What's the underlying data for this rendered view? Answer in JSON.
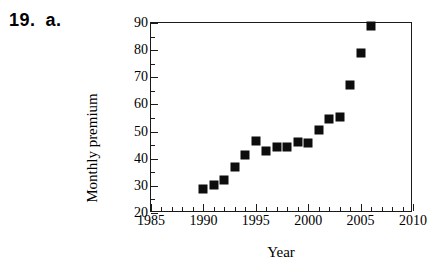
{
  "problem": {
    "number": "19.",
    "part": "a."
  },
  "chart_data": {
    "type": "scatter",
    "title": "",
    "xlabel": "Year",
    "ylabel": "Monthly premium",
    "xlim": [
      1985,
      2010
    ],
    "ylim": [
      20,
      90
    ],
    "grid": false,
    "legend": null,
    "x_major_ticks": [
      1985,
      1990,
      1995,
      2000,
      2005,
      2010
    ],
    "x_tick_labels": [
      "1985",
      "1990",
      "1995",
      "2000",
      "2005",
      "2010"
    ],
    "x_minor_tick_step": 1,
    "y_major_ticks": [
      20,
      30,
      40,
      50,
      60,
      70,
      80,
      90
    ],
    "y_tick_labels": [
      "20",
      "30",
      "40",
      "50",
      "60",
      "70",
      "80",
      "90"
    ],
    "y_minor_tick_step": 5,
    "marker": "filled-square",
    "marker_color": "#0d0d0d",
    "x": [
      1990,
      1991,
      1992,
      1993,
      1994,
      1995,
      1996,
      1997,
      1998,
      1999,
      2000,
      2001,
      2002,
      2003,
      2004,
      2005,
      2006
    ],
    "values": [
      29,
      30.2,
      32,
      37,
      41.5,
      46.5,
      43,
      44.2,
      44.3,
      46,
      45.9,
      50.5,
      54.5,
      55.3,
      67,
      79,
      89
    ],
    "points": [
      {
        "year": 1990,
        "premium": 29
      },
      {
        "year": 1991,
        "premium": 30.2
      },
      {
        "year": 1992,
        "premium": 32
      },
      {
        "year": 1993,
        "premium": 37
      },
      {
        "year": 1994,
        "premium": 41.5
      },
      {
        "year": 1995,
        "premium": 46.5
      },
      {
        "year": 1996,
        "premium": 43
      },
      {
        "year": 1997,
        "premium": 44.2
      },
      {
        "year": 1998,
        "premium": 44.3
      },
      {
        "year": 1999,
        "premium": 46
      },
      {
        "year": 2000,
        "premium": 45.9
      },
      {
        "year": 2001,
        "premium": 50.5
      },
      {
        "year": 2002,
        "premium": 54.5
      },
      {
        "year": 2003,
        "premium": 55.3
      },
      {
        "year": 2004,
        "premium": 67
      },
      {
        "year": 2005,
        "premium": 79
      },
      {
        "year": 2006,
        "premium": 89
      }
    ]
  }
}
